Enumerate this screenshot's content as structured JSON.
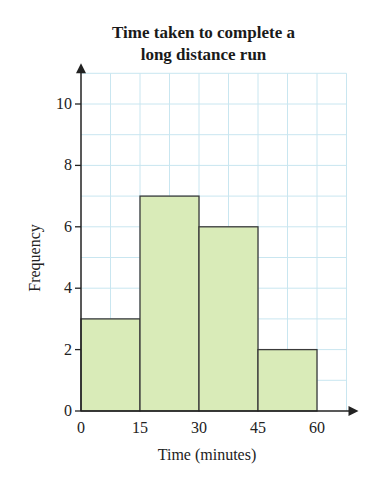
{
  "chart": {
    "title_line1": "Time taken to complete a",
    "title_line2": "long distance run",
    "xlabel": "Time (minutes)",
    "ylabel": "Frequency",
    "colors": {
      "bar_fill": "#d9ebb8",
      "bar_stroke": "#3a3a3a",
      "grid": "#c9e6f0",
      "axis": "#222222"
    }
  },
  "chart_data": {
    "type": "bar",
    "subtype": "histogram",
    "title": "Time taken to complete a long distance run",
    "xlabel": "Time (minutes)",
    "ylabel": "Frequency",
    "bins": [
      {
        "from": 0,
        "to": 15,
        "frequency": 3
      },
      {
        "from": 15,
        "to": 30,
        "frequency": 7
      },
      {
        "from": 30,
        "to": 45,
        "frequency": 6
      },
      {
        "from": 45,
        "to": 60,
        "frequency": 2
      }
    ],
    "categories": [
      "0-15",
      "15-30",
      "30-45",
      "45-60"
    ],
    "values": [
      3,
      7,
      6,
      2
    ],
    "x_ticks": [
      0,
      15,
      30,
      45,
      60
    ],
    "y_ticks": [
      0,
      2,
      4,
      6,
      8,
      10
    ],
    "xlim": [
      0,
      67.5
    ],
    "ylim": [
      0,
      11
    ],
    "grid": true,
    "legend": null
  }
}
